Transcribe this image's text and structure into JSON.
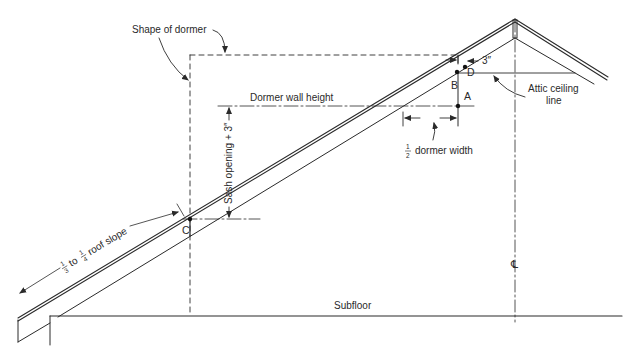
{
  "diagram": {
    "colors": {
      "line": "#2a2a2a",
      "background": "#ffffff"
    },
    "labels": {
      "shape_of_dormer": "Shape of dormer",
      "dormer_wall_height": "Dormer wall height",
      "sash_opening": "Sash opening + 3″",
      "half_dormer_width_num": "1",
      "half_dormer_width_den": "2",
      "half_dormer_width_text": "dormer width",
      "three_inch": "3″",
      "attic_ceiling_line_1": "Attic ceiling",
      "attic_ceiling_line_2": "line",
      "roof_slope_num1": "1",
      "roof_slope_den1": "3",
      "roof_slope_to": "to",
      "roof_slope_num2": "1",
      "roof_slope_den2": "4",
      "roof_slope_text": "roof slope",
      "subfloor": "Subfloor",
      "centerline": "℄"
    },
    "points": [
      {
        "id": "A",
        "label": "A"
      },
      {
        "id": "B",
        "label": "B"
      },
      {
        "id": "C",
        "label": "C"
      },
      {
        "id": "D",
        "label": "D"
      }
    ]
  }
}
